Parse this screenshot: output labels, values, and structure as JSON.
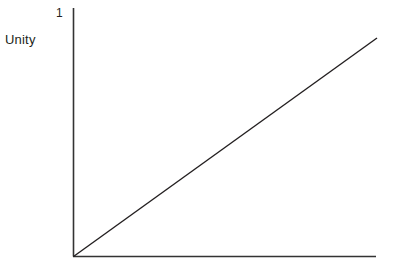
{
  "figure": {
    "background_color": "#ffffff",
    "width": 393,
    "height": 269
  },
  "labels": {
    "y_axis_title": "Unity",
    "y_tick_one": "1"
  },
  "chart_data": {
    "type": "line",
    "title": "",
    "subtitle": "",
    "xlabel": "",
    "ylabel": "Unity",
    "xlim": [
      0,
      1
    ],
    "ylim": [
      0,
      1
    ],
    "grid": false,
    "legend": null,
    "axis_color": "#333333",
    "line_color": "#231f20",
    "x_tick_labels": [],
    "y_tick_labels": [
      "1"
    ],
    "y_tick_values": [
      1
    ],
    "annotations": [],
    "series": [
      {
        "name": "unity-line",
        "x": [
          0,
          1
        ],
        "values": [
          0,
          1
        ],
        "style": "solid",
        "color": "#231f20",
        "width": 1.4
      }
    ],
    "axes": {
      "y_axis": {
        "x_px": 73.5,
        "y_top_px": 8,
        "y_bottom_px": 256.5,
        "spine": true
      },
      "x_axis": {
        "y_px": 256.5,
        "x_left_px": 73,
        "x_right_px": 376,
        "spine": true
      },
      "origin_px": [
        73.5,
        256.5
      ],
      "line_end_px": [
        377,
        38
      ]
    }
  }
}
